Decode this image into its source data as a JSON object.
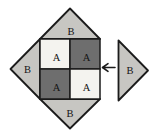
{
  "figure": {
    "block": {
      "top_triangle": {
        "label": "B"
      },
      "left_triangle": {
        "label": "B"
      },
      "bottom_triangle": {
        "label": "B"
      },
      "top_left_square": {
        "label": "A"
      },
      "top_right_square": {
        "label": "A"
      },
      "bottom_left_square": {
        "label": "A"
      },
      "bottom_right_square": {
        "label": "A"
      }
    },
    "detached_triangle": {
      "label": "B"
    },
    "arrow": {
      "glyph": "←",
      "direction": "left"
    }
  },
  "colors": {
    "background": "#ffffff",
    "triangle_fill": "#c7c6c2",
    "dark_square_fill": "#6e6e6e",
    "light_square_fill": "#f4f3ef",
    "outline": "#1b1b1b",
    "label_text": "#141414"
  }
}
